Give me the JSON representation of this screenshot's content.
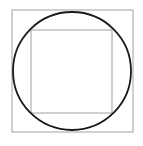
{
  "diagram": {
    "outer_square": {
      "x": 12,
      "y": 10,
      "width": 121,
      "height": 122,
      "stroke": "#b0b0b0"
    },
    "circle": {
      "cx": 72,
      "cy": 71,
      "r": 59,
      "stroke": "#1a1a1a"
    },
    "inner_square": {
      "x": 31,
      "y": 30,
      "width": 81,
      "height": 83,
      "stroke": "#b0b0b0"
    }
  }
}
